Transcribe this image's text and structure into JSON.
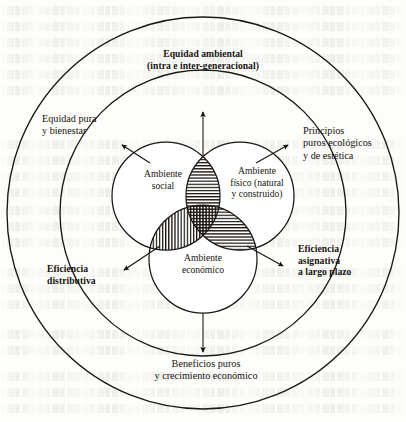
{
  "diagram": {
    "type": "concentric-venn",
    "title": "Equidad ambiental\n(intra e inter-generacional)",
    "outer_ring_labels": {
      "top": "Equidad ambiental\n(intra e inter-generacional)",
      "left": "Equidad pura\ny bienestar",
      "right": "Principios\npuros ecológicos\ny de estética",
      "bottom_left": "Eficiencia\ndistributiva",
      "bottom_right": "Eficiencia\nasignativa\na largo plazo",
      "bottom": "Beneficios puros\ny crecimiento económico"
    },
    "circles": [
      {
        "id": "social",
        "label": "Ambiente\nsocial"
      },
      {
        "id": "fisico",
        "label": "Ambiente\nfísico (natural\ny construido)"
      },
      {
        "id": "economico",
        "label": "Ambiente\neconómico"
      }
    ],
    "overlaps": [
      {
        "id": "social-fisico",
        "hatch": "horizontal"
      },
      {
        "id": "social-economico",
        "hatch": "vertical"
      },
      {
        "id": "fisico-economico",
        "hatch": "horizontal"
      },
      {
        "id": "triple-center",
        "hatch": "cross"
      }
    ],
    "arrows": [
      {
        "id": "arrow-top",
        "from": "social-fisico",
        "to": "top",
        "direction": "up"
      },
      {
        "id": "arrow-left",
        "from": "venn",
        "to": "left",
        "direction": "up-left"
      },
      {
        "id": "arrow-right",
        "from": "venn",
        "to": "right",
        "direction": "up-right"
      },
      {
        "id": "arrow-bottom-left",
        "from": "social-economico",
        "to": "bottom_left",
        "direction": "down-left"
      },
      {
        "id": "arrow-bottom-right",
        "from": "fisico-economico",
        "to": "bottom_right",
        "direction": "down-right"
      },
      {
        "id": "arrow-bottom",
        "from": "economico",
        "to": "bottom",
        "direction": "down"
      }
    ],
    "colors": {
      "ink": "#16120e",
      "stroke": "#1b1713",
      "paper": "#fdfdfb"
    }
  }
}
